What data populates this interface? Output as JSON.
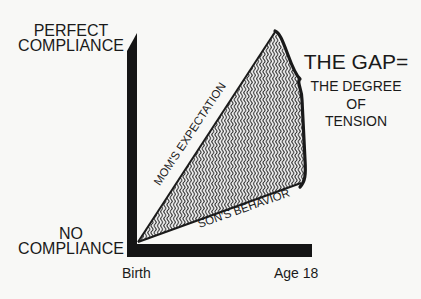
{
  "diagram": {
    "y_axis": {
      "top_label_lines": [
        "PERFECT",
        "COMPLIANCE"
      ],
      "bottom_label_lines": [
        "NO",
        "COMPLIANCE"
      ]
    },
    "x_axis": {
      "start_label": "Birth",
      "end_label": "Age 18"
    },
    "lines": {
      "expectation_label": "MOM'S EXPECTATION",
      "behavior_label": "SON'S BEHAVIOR"
    },
    "annotation": {
      "title": "THE GAP=",
      "subtitle_lines": [
        "THE DEGREE",
        "OF",
        "TENSION"
      ]
    },
    "colors": {
      "ink": "#1a1a1a",
      "background": "#f8f8f6",
      "hatch_fill": "#9a9a9a"
    }
  }
}
